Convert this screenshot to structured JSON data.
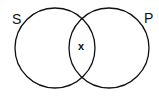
{
  "diagram": {
    "type": "venn",
    "stroke_color": "#111111",
    "background_color": "#ffffff",
    "sets": [
      {
        "label": "S",
        "cx": 55,
        "cy": 48,
        "r": 40
      },
      {
        "label": "P",
        "cx": 109,
        "cy": 48,
        "r": 40
      }
    ],
    "intersection_marker": "x"
  }
}
